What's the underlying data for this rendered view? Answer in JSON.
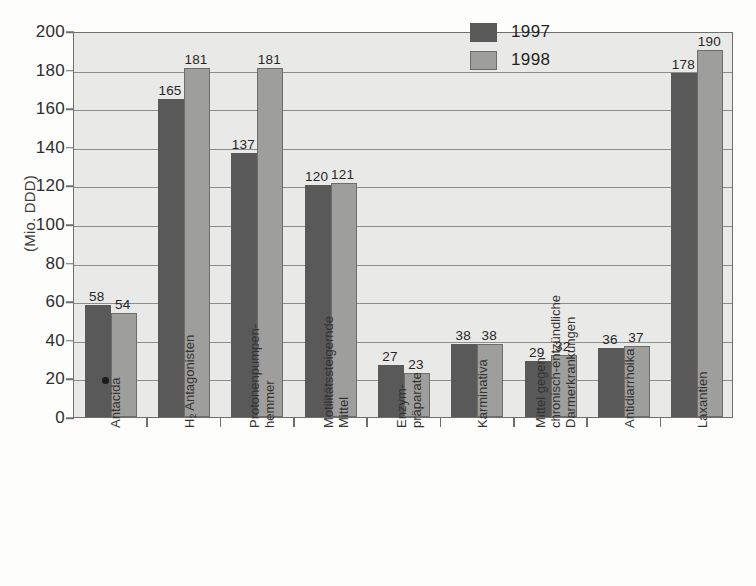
{
  "chart_data": {
    "type": "bar",
    "title": "",
    "xlabel": "",
    "ylabel": "(Mio. DDD)",
    "ylim": [
      0,
      200
    ],
    "ytick_step": 20,
    "yticks": [
      0,
      20,
      40,
      60,
      80,
      100,
      120,
      140,
      160,
      180,
      200
    ],
    "grid": true,
    "legend_position": "top-right",
    "categories": [
      "Antacida",
      "H2 Antagonisten",
      "Protonenpumpen-hemmer",
      "Motilitätssteigernde Mittel",
      "Enzym-präparate",
      "Karminativa",
      "Mittel gegen chronisch-entzündliche Darmerkrankungen",
      "Antidiarrhoika",
      "Laxantien"
    ],
    "category_lines": [
      [
        "Antacida"
      ],
      [
        "H2 Antagonisten"
      ],
      [
        "Protonenpumpen-",
        "hemmer"
      ],
      [
        "Motilitätssteigernde",
        "Mittel"
      ],
      [
        "Enzym-",
        "präparate"
      ],
      [
        "Karminativa"
      ],
      [
        "Mittel gegen",
        "chronisch-entzündliche",
        "Darmerkrankungen"
      ],
      [
        "Antidiarrhoika"
      ],
      [
        "Laxantien"
      ]
    ],
    "series": [
      {
        "name": "1997",
        "color": "#595959",
        "values": [
          58,
          165,
          137,
          120,
          27,
          38,
          29,
          36,
          178
        ]
      },
      {
        "name": "1998",
        "color": "#9e9e9c",
        "values": [
          54,
          181,
          181,
          121,
          23,
          38,
          32,
          37,
          190
        ]
      }
    ]
  },
  "legend": {
    "items": [
      {
        "label": "1997",
        "color": "#595959"
      },
      {
        "label": "1998",
        "color": "#9e9e9c"
      }
    ]
  },
  "axis": {
    "y_title": "(Mio. DDD)"
  }
}
